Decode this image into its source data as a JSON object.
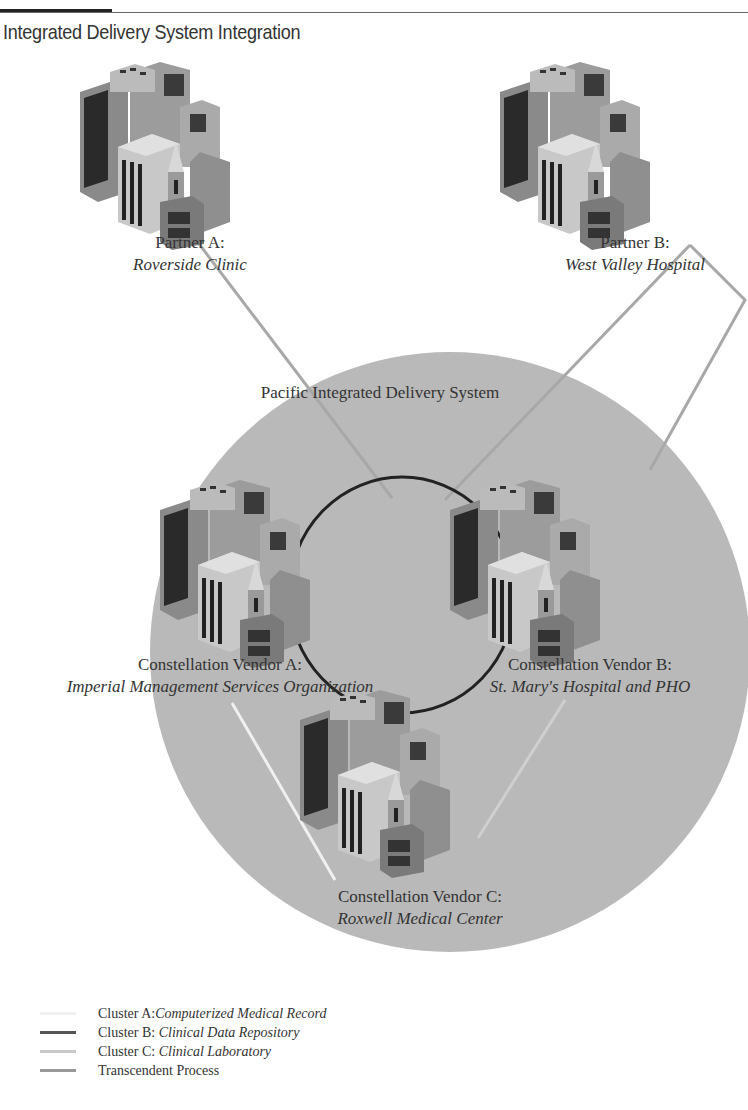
{
  "title": "Integrated Delivery System Integration",
  "system": {
    "label": "Pacific Integrated Delivery System",
    "circle_color": "#b8b8b8"
  },
  "nodes": [
    {
      "id": "partner-a",
      "heading": "Partner A:",
      "name": "Roverside Clinic",
      "icon": "building-icon"
    },
    {
      "id": "partner-b",
      "heading": "Partner B:",
      "name": "West Valley Hospital",
      "icon": "building-icon"
    },
    {
      "id": "vendor-a",
      "heading": "Constellation Vendor A:",
      "name": "Imperial Management Services Organization",
      "icon": "building-icon"
    },
    {
      "id": "vendor-b",
      "heading": "Constellation Vendor B:",
      "name": "St. Mary's Hospital and PHO",
      "icon": "building-icon"
    },
    {
      "id": "vendor-c",
      "heading": "Constellation Vendor C:",
      "name": "Roxwell Medical Center",
      "icon": "building-icon"
    }
  ],
  "legend": [
    {
      "prefix": "Cluster A:",
      "name": "Computerized Medical Record",
      "color": "#f2f2f2"
    },
    {
      "prefix": "Cluster B: ",
      "name": "Clinical Data Repository",
      "color": "#555555"
    },
    {
      "prefix": "Cluster C: ",
      "name": "Clinical Laboratory",
      "color": "#c8c8c8"
    },
    {
      "prefix": "Transcendent Process",
      "name": "",
      "color": "#999999"
    }
  ]
}
